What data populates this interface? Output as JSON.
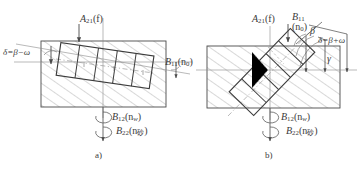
{
  "figure": {
    "title_note": "two-part mechanical machining schematic",
    "stroke_color": "#4a4a4a",
    "hatch_color": "#8c8c8c",
    "axis_color": "#8a8a8a",
    "text_color": "#3a3a3a",
    "background": "#ffffff"
  },
  "panel_a": {
    "caption": "a)",
    "labels": {
      "feed": {
        "main": "A",
        "sub": "21",
        "arg": "(f)"
      },
      "delta": "δ=β−ω",
      "b11": {
        "main": "B",
        "sub": "11",
        "arg": "(n",
        "argsub": "0",
        "argend": ")"
      },
      "b12": {
        "main": "B",
        "sub": "12",
        "arg": "(n",
        "argsub": "w",
        "argend": ")"
      },
      "b22": {
        "main": "B",
        "sub": "22",
        "arg": "(n",
        "argsub": "砂",
        "argend": ")"
      }
    }
  },
  "panel_b": {
    "caption": "b)",
    "labels": {
      "feed": {
        "main": "A",
        "sub": "21",
        "arg": "(f)"
      },
      "b11": {
        "main": "B",
        "sub": "11",
        "arg": "(n",
        "argsub": "0",
        "argend": ")"
      },
      "beta": "β",
      "delta": "δ=β+ω",
      "gamma": "γ",
      "b12": {
        "main": "B",
        "sub": "12",
        "arg": "(n",
        "argsub": "w",
        "argend": ")"
      },
      "b22": {
        "main": "B",
        "sub": "22",
        "arg": "(n",
        "argsub": "砂",
        "argend": ")"
      }
    }
  }
}
